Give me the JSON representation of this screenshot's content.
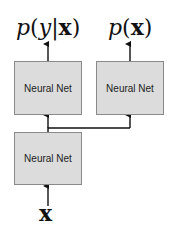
{
  "outputs": {
    "conditional": {
      "p": "p",
      "open": "(",
      "y": "y",
      "bar": "|",
      "x": "x",
      "close": ")"
    },
    "marginal": {
      "p": "p",
      "open": "(",
      "x": "x",
      "close": ")"
    }
  },
  "boxes": {
    "top_left": {
      "label": "Neural Net"
    },
    "top_right": {
      "label": "Neural Net"
    },
    "bottom": {
      "label": "Neural Net"
    }
  },
  "input": {
    "label": "x"
  },
  "colors": {
    "box_fill": "#dcdcdc",
    "box_border": "#8a8a8a",
    "arrow": "#111111"
  }
}
